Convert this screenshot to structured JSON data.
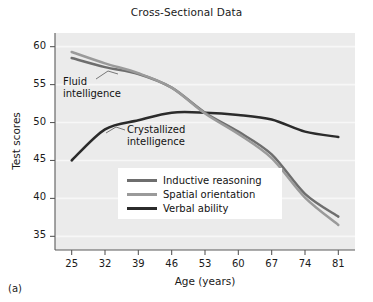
{
  "figure": {
    "panel_label": "(a)",
    "title": "Cross-Sectional Data"
  },
  "annotations": {
    "fluid_line1": "Fluid",
    "fluid_line2": "intelligence",
    "crystallized_line1": "Crystallized",
    "crystallized_line2": "intelligence"
  },
  "colors": {
    "plot_background": "#ebebeb",
    "gridline": "#f7f7f7",
    "axis": "#4a4a4a",
    "inductive_reasoning": "#6e6e6e",
    "spatial_orientation": "#9a9a9a",
    "verbal_ability": "#2b2b2b",
    "text": "#1a1a1a"
  },
  "chart_data": {
    "type": "line",
    "title": "Cross-Sectional Data",
    "xlabel": "Age (years)",
    "ylabel": "Test scores",
    "x": [
      25,
      32,
      39,
      46,
      53,
      60,
      67,
      74,
      81
    ],
    "categories": [
      "25",
      "32",
      "39",
      "46",
      "53",
      "60",
      "67",
      "74",
      "81"
    ],
    "xlim": [
      21.5,
      84.5
    ],
    "ylim": [
      33.2,
      61.8
    ],
    "yticks": [
      35,
      40,
      45,
      50,
      55,
      60
    ],
    "xticks": [
      25,
      32,
      39,
      46,
      53,
      60,
      67,
      74,
      81
    ],
    "grid": "horizontal",
    "legend_position": "center",
    "series": [
      {
        "name": "Inductive reasoning",
        "color": "#6e6e6e",
        "values": [
          58.5,
          57.3,
          56.4,
          54.6,
          51.3,
          48.8,
          45.8,
          40.6,
          37.6
        ]
      },
      {
        "name": "Spatial orientation",
        "color": "#9a9a9a",
        "values": [
          59.3,
          57.8,
          56.5,
          54.6,
          51.2,
          48.5,
          45.3,
          40.1,
          36.5
        ]
      },
      {
        "name": "Verbal ability",
        "color": "#2b2b2b",
        "values": [
          45.0,
          49.1,
          50.3,
          51.3,
          51.3,
          51.0,
          50.4,
          48.8,
          48.1
        ]
      }
    ],
    "annotations": [
      {
        "text": "Fluid intelligence",
        "points_to": "Inductive reasoning / Spatial orientation curves"
      },
      {
        "text": "Crystallized intelligence",
        "points_to": "Verbal ability curve"
      }
    ]
  },
  "legend": {
    "items": [
      {
        "label": "Inductive reasoning",
        "color": "#6e6e6e"
      },
      {
        "label": "Spatial orientation",
        "color": "#9a9a9a"
      },
      {
        "label": "Verbal ability",
        "color": "#2b2b2b"
      }
    ]
  }
}
